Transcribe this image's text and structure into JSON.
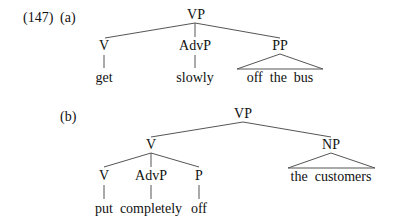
{
  "example": {
    "number": "(147)",
    "parts": [
      {
        "label": "(a)",
        "root": "VP",
        "children": [
          {
            "category": "V",
            "word": "get"
          },
          {
            "category": "AdvP",
            "word": "slowly"
          },
          {
            "category": "PP",
            "word": "off  the  bus",
            "triangle": true
          }
        ]
      },
      {
        "label": "(b)",
        "root": "VP",
        "children": [
          {
            "category": "V",
            "children": [
              {
                "category": "V",
                "word": "put"
              },
              {
                "category": "AdvP",
                "word": "completely"
              },
              {
                "category": "P",
                "word": "off"
              }
            ]
          },
          {
            "category": "NP",
            "word": "the  customers",
            "triangle": true
          }
        ]
      }
    ]
  },
  "style": {
    "line_color": "#555555",
    "text_color": "#111111"
  }
}
